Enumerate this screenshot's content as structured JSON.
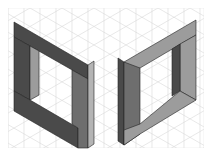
{
  "diagram": {
    "title": "",
    "canvas": {
      "width": 212,
      "height": 156,
      "background": "#ffffff"
    },
    "grid": {
      "type": "isometric-triangular",
      "color": "#d9d9d9",
      "spacing_x": 16,
      "spacing_y": 9.2,
      "area": {
        "x": 8,
        "y": 8,
        "width": 196,
        "height": 140
      }
    },
    "colors": {
      "dark_face": "#4a4a4a",
      "medium_face": "#6e6e6e",
      "light_face": "#9c9c9c",
      "lighter_face": "#b4b4b4",
      "edge": "#222222",
      "facet_line": "#3a3a3a"
    },
    "shapes": [
      {
        "name": "left-bracket",
        "orientation": "opens-right"
      },
      {
        "name": "right-bracket",
        "orientation": "opens-left"
      }
    ]
  }
}
